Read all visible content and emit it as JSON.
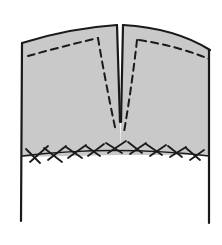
{
  "diagram": {
    "colors": {
      "fill": "#c9c9c9",
      "line": "#1a1a1a",
      "background": "#ffffff"
    },
    "parts": {
      "left_panel": "left-facing-panel",
      "right_panel": "right-facing-panel",
      "slit": "center-slit",
      "stitching": "dashed-stitch-lines",
      "catch_stitch": "cross-stitch-hem"
    }
  }
}
